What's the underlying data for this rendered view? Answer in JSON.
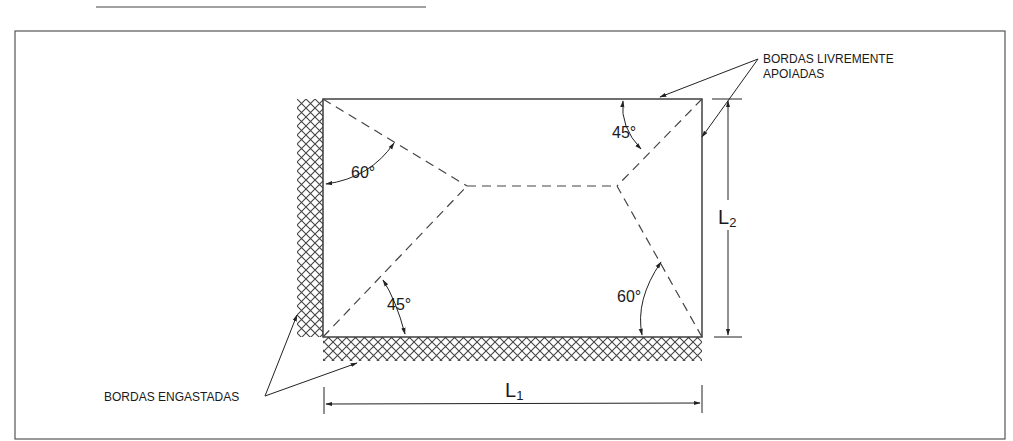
{
  "figure": {
    "type": "diagram",
    "colors": {
      "line": "#333333",
      "hatch": "#444444",
      "background": "#ffffff",
      "frame": "#555555"
    }
  },
  "labels": {
    "free_edges_line1": "BORDAS LIVREMENTE",
    "free_edges_line2": "APOIADAS",
    "clamped_edges": "BORDAS ENGASTADAS",
    "angle_top_left": "60°",
    "angle_top_right": "45°",
    "angle_bottom_left": "45°",
    "angle_bottom_right": "60°",
    "dim_horizontal_main": "L",
    "dim_horizontal_sub": "1",
    "dim_vertical_main": "L",
    "dim_vertical_sub": "2"
  },
  "geometry": {
    "plate": {
      "x": 323,
      "y": 99,
      "width": 379,
      "height": 238
    },
    "ridge_left": {
      "x": 467,
      "y": 186
    },
    "ridge_right": {
      "x": 617,
      "y": 186
    },
    "clamped_edges": [
      "left",
      "bottom"
    ],
    "supported_edges": [
      "top",
      "right"
    ]
  }
}
